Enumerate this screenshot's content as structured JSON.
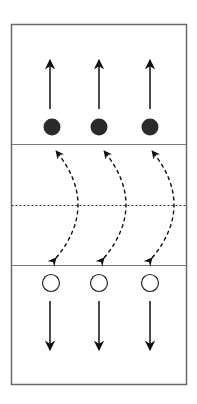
{
  "diagram": {
    "title": "Court drill diagram",
    "colors": {
      "court_line": "#6a6a6a",
      "arrow": "#111111",
      "player_filled": "#2b2b2b",
      "player_open_stroke": "#222222",
      "background": "#ffffff"
    },
    "court": {
      "x": 11,
      "y": 24,
      "width": 175,
      "height": 360
    },
    "lines": {
      "upper_attack_line_y": 144,
      "center_line_y": 205,
      "lower_attack_line_y": 265
    },
    "players_filled": [
      {
        "id": "filled-player-1",
        "cx": 52,
        "cy": 127
      },
      {
        "id": "filled-player-2",
        "cx": 99,
        "cy": 127
      },
      {
        "id": "filled-player-3",
        "cx": 150,
        "cy": 127
      }
    ],
    "players_open": [
      {
        "id": "open-player-1",
        "cx": 51,
        "cy": 283
      },
      {
        "id": "open-player-2",
        "cx": 99,
        "cy": 283
      },
      {
        "id": "open-player-3",
        "cx": 150,
        "cy": 283
      }
    ],
    "legend": {
      "filled": "Team A players (move up)",
      "open": "Team B players (move down)",
      "dashed_arrow": "Ball / crossing path"
    }
  }
}
